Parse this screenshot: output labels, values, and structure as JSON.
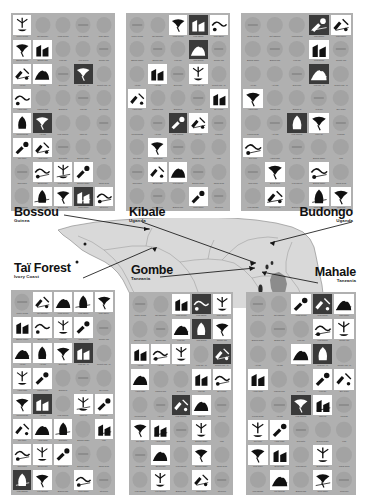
{
  "figure": {
    "legend": {
      "present_label": "behaviour present",
      "absent_label": "behaviour absent"
    }
  },
  "behaviours": [
    "Pestle pound",
    "Nut hammer",
    "Food pound",
    "Leaf napkin",
    "Rain dance",
    "Branch shake",
    "Branch slap",
    "Leaf clip",
    "Leaf groom",
    "Termite fish",
    "Ant dip",
    "Ant fish",
    "Expel/Stir",
    "Leaf clip - M",
    "Termite fish - M",
    "Hand clasp",
    "Marrow pick",
    "Branch di",
    "Leaf dip",
    "Bee probe",
    "Pound broad",
    "Ant fish",
    "Leaf sponge",
    "Index hit",
    "Fluid dip",
    "Self tickle",
    "Hand clasp",
    "Dig water",
    "Branch shake",
    "Fish",
    "Club finger",
    "Brush back",
    "Leaf inspect",
    "Branch shake",
    "Shrub bend",
    "Leaf squash",
    "Pull through",
    "Branch slap",
    "Rock shake",
    "Stem pull"
  ],
  "sites": [
    {
      "id": "bossou",
      "name": "Bossou",
      "country": "Guinea",
      "present": [
        0,
        5,
        6,
        10,
        13,
        15,
        21,
        31,
        32,
        33,
        36,
        37,
        38,
        39,
        25,
        26,
        20,
        11
      ],
      "dark": [
        13,
        21,
        38
      ]
    },
    {
      "id": "kibale",
      "name": "Kibale",
      "country": "Uganda",
      "present": [
        2,
        3,
        4,
        8,
        11,
        13,
        15,
        19,
        22,
        23,
        26,
        31,
        32,
        38
      ],
      "dark": [
        3,
        8,
        22
      ]
    },
    {
      "id": "budongo",
      "name": "Budongo",
      "country": "Uganda",
      "present": [
        3,
        4,
        8,
        13,
        15,
        22,
        23,
        25,
        31,
        33,
        36,
        38,
        39
      ],
      "dark": [
        3,
        13,
        22
      ]
    },
    {
      "id": "tai-forest",
      "name": "Taï Forest",
      "country": "Ivory Coast",
      "present": [
        1,
        2,
        3,
        4,
        5,
        6,
        7,
        8,
        10,
        11,
        12,
        13,
        15,
        16,
        20,
        21,
        23,
        24,
        25,
        26,
        27,
        29,
        30,
        31,
        32,
        35,
        36,
        38
      ],
      "dark": [
        13,
        21,
        35
      ]
    },
    {
      "id": "gombe",
      "name": "Gombe",
      "country": "Tanzania",
      "present": [
        2,
        3,
        4,
        7,
        8,
        9,
        10,
        11,
        12,
        14,
        15,
        18,
        19,
        22,
        23,
        25,
        26,
        28,
        31,
        33,
        36,
        38
      ],
      "dark": [
        3,
        8,
        14,
        22
      ]
    },
    {
      "id": "mahale",
      "name": "Mahale",
      "country": "Tanzania",
      "present": [
        2,
        3,
        4,
        8,
        9,
        12,
        13,
        15,
        18,
        19,
        22,
        23,
        25,
        26,
        30,
        31,
        33,
        36,
        38
      ],
      "dark": [
        3,
        13,
        22
      ]
    }
  ],
  "colors": {
    "panel_background": "#b0b0b0",
    "absent_marker": "#a3a3a3",
    "present_background": "#ffffff",
    "present_dark_background": "#3a3a3a",
    "map_land": "#d9d9d9",
    "map_water": "#ffffff",
    "label_text": "#111111",
    "caption_text": "#4a4a4a"
  }
}
